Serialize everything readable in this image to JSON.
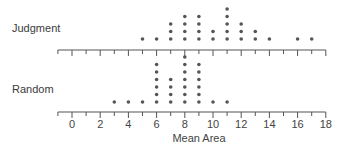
{
  "chart_data": {
    "type": "scatter",
    "subtype": "dot-plot",
    "title": "",
    "xlabel": "Mean Area",
    "ylabel": "",
    "xlim": [
      -1,
      18
    ],
    "x_ticks": [
      0,
      2,
      4,
      6,
      8,
      10,
      12,
      14,
      16,
      18
    ],
    "grid": false,
    "legend": null,
    "series": [
      {
        "name": "Judgment",
        "x": [
          5,
          6,
          7,
          8,
          9,
          10,
          11,
          12,
          13,
          14,
          16,
          17
        ],
        "counts": [
          1,
          1,
          3,
          4,
          4,
          2,
          5,
          3,
          2,
          1,
          1,
          1
        ]
      },
      {
        "name": "Random",
        "x": [
          3,
          4,
          5,
          6,
          7,
          8,
          9,
          10,
          11
        ],
        "counts": [
          1,
          1,
          1,
          6,
          4,
          7,
          6,
          1,
          1
        ]
      }
    ]
  },
  "labels": {
    "judgment": "Judgment",
    "random": "Random",
    "xaxis": "Mean Area"
  }
}
